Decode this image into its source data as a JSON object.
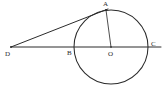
{
  "figure": {
    "width": 164,
    "height": 86,
    "background_color": "#ffffff",
    "stroke_color": "#2b2b2b"
  },
  "circle": {
    "name": "main-circle",
    "center_x": 111,
    "center_y": 47,
    "radius": 37
  },
  "points": [
    {
      "id": "A",
      "label": "A",
      "x": 106,
      "y": 10,
      "label_x": 103,
      "label_y": 1
    },
    {
      "id": "D",
      "label": "D",
      "x": 11,
      "y": 47,
      "label_x": 5,
      "label_y": 51
    },
    {
      "id": "B",
      "label": "B",
      "x": 74,
      "y": 47,
      "label_x": 67,
      "label_y": 50
    },
    {
      "id": "O",
      "label": "O",
      "x": 111,
      "y": 47,
      "label_x": 108,
      "label_y": 51
    },
    {
      "id": "C",
      "label": "C",
      "x": 148,
      "y": 47,
      "label_x": 151,
      "label_y": 41
    }
  ],
  "segments": [
    {
      "id": "DA",
      "from": "D",
      "to": "A",
      "x1": 11,
      "y1": 47,
      "x2": 107,
      "y2": 9
    },
    {
      "id": "DC",
      "from": "D",
      "to": "C",
      "x1": 11,
      "y1": 47,
      "x2": 160,
      "y2": 47
    },
    {
      "id": "OA",
      "from": "O",
      "to": "A",
      "x1": 111,
      "y1": 47,
      "x2": 106,
      "y2": 10
    }
  ]
}
